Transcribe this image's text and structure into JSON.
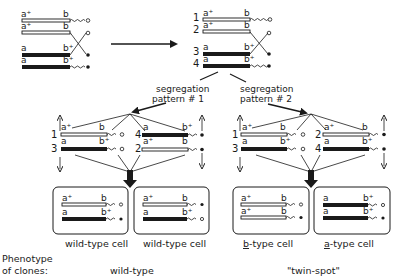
{
  "figure": {
    "colors": {
      "ink": "#1a1a1a",
      "background": "#ffffff",
      "wild_chromatid_fill": "#ffffff",
      "mutant_chromatid_fill": "#1a1a1a"
    }
  },
  "initial": {
    "chromatids": [
      {
        "left_allele": "a⁺",
        "right_allele": "b",
        "style": "open"
      },
      {
        "left_allele": "a⁺",
        "right_allele": "b",
        "style": "open"
      },
      {
        "left_allele": "a",
        "right_allele": "b⁺",
        "style": "filled"
      },
      {
        "left_allele": "a",
        "right_allele": "b⁺",
        "style": "filled"
      }
    ]
  },
  "after_crossover": {
    "chromatids": [
      {
        "number": "1",
        "left_allele": "a⁺",
        "right_allele": "b"
      },
      {
        "number": "2",
        "left_allele": "a⁺",
        "right_allele": "b"
      },
      {
        "number": "3",
        "left_allele": "a",
        "right_allele": "b⁺"
      },
      {
        "number": "4",
        "left_allele": "a",
        "right_allele": "b⁺"
      }
    ]
  },
  "patterns": [
    {
      "label_line1": "segregation",
      "label_line2": "pattern # 1",
      "left_pair": [
        {
          "number": "1",
          "left_allele": "a⁺",
          "right_allele": "b"
        },
        {
          "number": "3",
          "left_allele": "a",
          "right_allele": "b⁺"
        }
      ],
      "right_pair": [
        {
          "number": "4",
          "left_allele": "a",
          "right_allele": "b⁺"
        },
        {
          "number": "2",
          "left_allele": "a⁺",
          "right_allele": "b"
        }
      ],
      "cells": [
        {
          "label": "wild-type cell",
          "rows": [
            {
              "left": "a⁺",
              "right": "b"
            },
            {
              "left": "a",
              "right": "b⁺"
            }
          ]
        },
        {
          "label": "wild-type cell",
          "rows": [
            {
              "left": "a⁺",
              "right": "b"
            },
            {
              "left": "a",
              "right": "b⁺"
            }
          ]
        }
      ],
      "phenotype": "wild-type"
    },
    {
      "label_line1": "segregation",
      "label_line2": "pattern # 2",
      "left_pair": [
        {
          "number": "1",
          "left_allele": "a⁺",
          "right_allele": "b"
        },
        {
          "number": "3",
          "left_allele": "a",
          "right_allele": "b⁺"
        }
      ],
      "right_pair": [
        {
          "number": "2",
          "left_allele": "a⁺",
          "right_allele": "b"
        },
        {
          "number": "4",
          "left_allele": "a",
          "right_allele": "b⁺"
        }
      ],
      "cells": [
        {
          "label_prefix": "b",
          "label_suffix": "-type cell",
          "rows": [
            {
              "left": "a⁺",
              "right": "b"
            },
            {
              "left": "a⁺",
              "right": "b"
            }
          ]
        },
        {
          "label_prefix": "a",
          "label_suffix": "-type cell",
          "rows": [
            {
              "left": "a",
              "right": "b⁺"
            },
            {
              "left": "a",
              "right": "b⁺"
            }
          ]
        }
      ],
      "phenotype": "\"twin-spot\""
    }
  ],
  "phenotype_label_line1": "Phenotype",
  "phenotype_label_line2": "of clones:"
}
